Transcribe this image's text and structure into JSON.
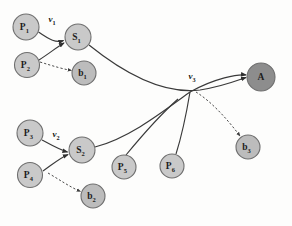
{
  "diagram": {
    "type": "directed-graph",
    "background_color": "#fdfdfc",
    "node_fill_light": "#c9c9c9",
    "node_fill_dark": "#8d8d8d",
    "node_stroke": "#6f6f6f",
    "edge_color": "#3a3a3a",
    "nodes": [
      {
        "id": "P1",
        "base": "P",
        "sub": "1",
        "cx": 26,
        "cy": 27,
        "r": 13.0,
        "shade": "light"
      },
      {
        "id": "P2",
        "base": "P",
        "sub": "2",
        "cx": 27,
        "cy": 65,
        "r": 12.5,
        "shade": "light"
      },
      {
        "id": "S1",
        "base": "S",
        "sub": "1",
        "cx": 78,
        "cy": 37,
        "r": 13.0,
        "shade": "light"
      },
      {
        "id": "b1",
        "base": "b",
        "sub": "1",
        "cx": 84,
        "cy": 73,
        "r": 12.0,
        "shade": "mid"
      },
      {
        "id": "P3",
        "base": "P",
        "sub": "3",
        "cx": 30,
        "cy": 133,
        "r": 13.0,
        "shade": "light"
      },
      {
        "id": "P4",
        "base": "P",
        "sub": "4",
        "cx": 30,
        "cy": 175,
        "r": 12.5,
        "shade": "light"
      },
      {
        "id": "S2",
        "base": "S",
        "sub": "2",
        "cx": 82,
        "cy": 150,
        "r": 13.0,
        "shade": "light"
      },
      {
        "id": "b2",
        "base": "b",
        "sub": "2",
        "cx": 93,
        "cy": 196,
        "r": 12.0,
        "shade": "mid"
      },
      {
        "id": "P5",
        "base": "P",
        "sub": "5",
        "cx": 124,
        "cy": 167,
        "r": 12.0,
        "shade": "light"
      },
      {
        "id": "P6",
        "base": "P",
        "sub": "6",
        "cx": 172,
        "cy": 166,
        "r": 12.0,
        "shade": "light"
      },
      {
        "id": "b3",
        "base": "b",
        "sub": "3",
        "cx": 248,
        "cy": 147,
        "r": 12.0,
        "shade": "mid"
      },
      {
        "id": "A",
        "base": "A",
        "sub": "",
        "cx": 261,
        "cy": 77,
        "r": 14.0,
        "shade": "dark"
      }
    ],
    "edges": [
      {
        "id": "P1-S1",
        "from": "P1",
        "to": "S1",
        "style": "solid",
        "arrow": true,
        "path": "M 38.5 32 C 50 40 56 43 63.5 40.5"
      },
      {
        "id": "P2-S1",
        "from": "P2",
        "to": "S1",
        "style": "solid",
        "arrow": true,
        "path": "M 39 60 C 50 53 57 47 64 43"
      },
      {
        "id": "S1-b1",
        "from": "S1",
        "to": "b1",
        "style": "dashed",
        "arrow": true,
        "path": "M 40 62 C 53 66 63 69 71.5 70.5"
      },
      {
        "id": "S1-A",
        "from": "S1",
        "to": "A",
        "style": "solid",
        "arrow": true,
        "path": "M 89 45 C 120 70 160 95 200 90 C 225 86 238 80 246 77.5"
      },
      {
        "id": "P3-S2",
        "from": "P3",
        "to": "S2",
        "style": "solid",
        "arrow": true,
        "path": "M 42 140 C 53 146 60 150 67.5 152"
      },
      {
        "id": "P4-S2",
        "from": "P4",
        "to": "S2",
        "style": "solid",
        "arrow": true,
        "path": "M 43 171 C 53 164 60 158 68 154.5"
      },
      {
        "id": "S2-b2",
        "from": "S2",
        "to": "b2",
        "style": "dashed",
        "arrow": true,
        "path": "M 48 173 C 60 180 70 187 80.5 191.5"
      },
      {
        "id": "S2-A",
        "from": "S2",
        "to": "A",
        "style": "solid",
        "arrow": true,
        "path": "M 95 147 C 130 138 165 110 190 92 C 215 78 238 74 246 75"
      },
      {
        "id": "P5-A",
        "from": "P5",
        "to": "A",
        "style": "solid",
        "arrow": false,
        "path": "M 126 155 C 140 138 160 115 178 99"
      },
      {
        "id": "P6-A",
        "from": "P6",
        "to": "A",
        "style": "solid",
        "arrow": false,
        "path": "M 176 154 C 182 135 187 110 190 92"
      },
      {
        "id": "conv-b3",
        "from": "A",
        "to": "b3",
        "style": "dashed",
        "arrow": true,
        "path": "M 196 92 C 212 102 228 120 240 136"
      }
    ],
    "edge_labels": [
      {
        "id": "v1",
        "base": "v",
        "sub": "1",
        "x": 52,
        "y": 19
      },
      {
        "id": "v2",
        "base": "v",
        "sub": "2",
        "x": 56,
        "y": 134
      },
      {
        "id": "v3",
        "base": "v",
        "sub": "3",
        "x": 192,
        "y": 76
      }
    ]
  }
}
